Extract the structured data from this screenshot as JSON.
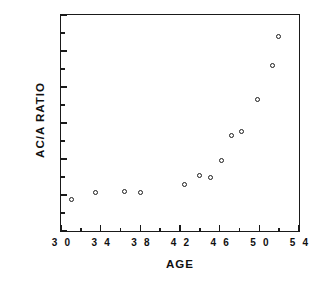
{
  "chart_data": {
    "type": "scatter",
    "title": "",
    "xlabel": "AGE",
    "ylabel": "AC/A  RATIO",
    "xlim": [
      30,
      54
    ],
    "ylim": [
      0,
      30
    ],
    "grid": false,
    "legend": null,
    "marker": "open-circle",
    "marker_color": "#1c1c1c",
    "x_major_ticks": [
      30,
      34,
      38,
      42,
      46,
      50,
      54
    ],
    "x_minor_ticks": [
      32,
      36,
      40,
      44,
      48,
      52
    ],
    "x_tick_labels": [
      "3 0",
      "3 4",
      "3 8",
      "4 2",
      "4 6",
      "5 0",
      "5 4"
    ],
    "y_major_ticks": [
      0,
      5,
      10,
      15,
      20,
      25,
      30
    ],
    "y_minor_ticks": [
      2.5,
      7.5,
      12.5,
      17.5,
      22.5,
      27.5
    ],
    "y_tick_labels": [
      "0",
      "5",
      "10",
      "15",
      "20",
      "25",
      "30"
    ],
    "points": [
      {
        "x": 31.1,
        "y": 4.4
      },
      {
        "x": 33.5,
        "y": 5.4
      },
      {
        "x": 36.4,
        "y": 5.5
      },
      {
        "x": 38.0,
        "y": 5.3
      },
      {
        "x": 42.5,
        "y": 6.4
      },
      {
        "x": 44.0,
        "y": 7.7
      },
      {
        "x": 45.1,
        "y": 7.5
      },
      {
        "x": 46.2,
        "y": 9.8
      },
      {
        "x": 47.2,
        "y": 13.2
      },
      {
        "x": 48.2,
        "y": 13.8
      },
      {
        "x": 49.8,
        "y": 18.2
      },
      {
        "x": 51.3,
        "y": 23.0
      },
      {
        "x": 51.9,
        "y": 27.0
      }
    ]
  }
}
